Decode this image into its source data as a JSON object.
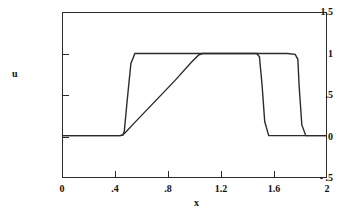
{
  "chart_data": {
    "type": "line",
    "title": "u vs x",
    "xlabel": "x",
    "ylabel": "u",
    "xlim": [
      0,
      2
    ],
    "ylim": [
      -0.5,
      1.5
    ],
    "grid": false,
    "legend": "none",
    "xticks": [
      "0",
      ".4",
      ".8",
      "1.2",
      "1.6",
      "2"
    ],
    "xtick_values": [
      0,
      0.4,
      0.8,
      1.2,
      1.6,
      2
    ],
    "yticks": [
      "1.5",
      "1",
      ".5",
      "0",
      "- .5"
    ],
    "ytick_values": [
      1.5,
      1,
      0.5,
      0,
      -0.5
    ],
    "series": [
      {
        "name": "square-pulse",
        "color": "#2b2b2b",
        "x": [
          0.0,
          0.44,
          0.46,
          0.47,
          0.49,
          0.52,
          0.55,
          1.05,
          1.45,
          1.7,
          1.76,
          1.78,
          1.79,
          1.81,
          1.84,
          2.0
        ],
        "y": [
          0.01,
          0.01,
          0.02,
          0.06,
          0.4,
          0.88,
          1.0,
          1.0,
          1.0,
          1.0,
          0.99,
          0.93,
          0.6,
          0.14,
          0.01,
          0.01
        ]
      },
      {
        "name": "ramp-pulse",
        "color": "#2b2b2b",
        "x": [
          0.0,
          0.44,
          0.46,
          0.48,
          0.55,
          0.7,
          0.85,
          0.98,
          1.03,
          1.06,
          1.1,
          1.4,
          1.47,
          1.49,
          1.51,
          1.53,
          1.56,
          2.0
        ],
        "y": [
          0.01,
          0.01,
          0.02,
          0.05,
          0.17,
          0.42,
          0.67,
          0.9,
          0.98,
          1.0,
          1.0,
          1.0,
          1.0,
          0.96,
          0.62,
          0.18,
          0.01,
          0.01
        ]
      }
    ]
  }
}
